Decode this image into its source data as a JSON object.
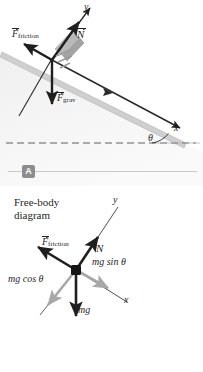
{
  "figure": {
    "panels": [
      {
        "id": "A",
        "badge": "A",
        "kind": "inclined-plane-force-diagram",
        "labels": {
          "y_axis": "y",
          "x_axis": "x",
          "angle": "θ",
          "normal_force": "N",
          "friction_force_symbol": "F",
          "friction_force_subscript": "friction",
          "gravity_force_symbol": "F",
          "gravity_force_subscript": "grav"
        }
      },
      {
        "id": "B",
        "badge": "B",
        "kind": "free-body-diagram",
        "title_line1": "Free-body",
        "title_line2": "diagram",
        "labels": {
          "y_axis": "y",
          "x_axis": "x",
          "normal_force": "N",
          "friction_force_symbol": "F",
          "friction_force_subscript": "friction",
          "weight": "mg",
          "weight_parallel": "mg sin θ",
          "weight_perpendicular": "mg cos θ"
        }
      }
    ]
  },
  "colors": {
    "vector_black": "#1f1f1f",
    "vector_gray": "#a8a8a8",
    "incline_gray": "#b9b9b9",
    "incline_fill": "#d8d8d8",
    "badge_gray": "#8d8d8d",
    "rule_gray": "#c9c9c9",
    "dashed_gray": "#6f6f6f",
    "background": "#ffffff"
  }
}
